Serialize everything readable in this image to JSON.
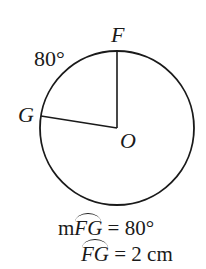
{
  "diagram": {
    "circle": {
      "center_label": "O",
      "cx": 117,
      "cy": 128,
      "r": 77
    },
    "points": [
      {
        "label": "F",
        "x": 117,
        "y": 51
      },
      {
        "label": "G",
        "x": 41,
        "y": 116
      }
    ],
    "arc_angle_label": "80°",
    "equations": [
      {
        "prefix": "m",
        "arc": "FG",
        "rest": " = 80°"
      },
      {
        "prefix": "",
        "arc": "FG",
        "rest": " = 2 cm"
      }
    ],
    "stroke_color": "#1a1a1a"
  }
}
